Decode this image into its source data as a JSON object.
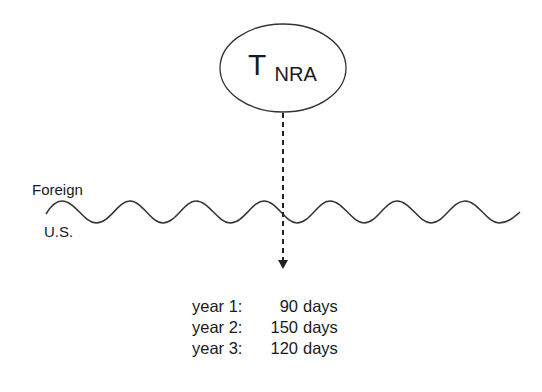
{
  "node": {
    "symbol": "T",
    "subscript": "NRA"
  },
  "labels": {
    "above_border": "Foreign",
    "below_border": "U.S."
  },
  "stays": [
    {
      "year": "year 1:",
      "value": "90",
      "unit": "days"
    },
    {
      "year": "year 2:",
      "value": "150",
      "unit": "days"
    },
    {
      "year": "year 3:",
      "value": "120",
      "unit": "days"
    }
  ],
  "colors": {
    "stroke": "#333333",
    "text": "#1a1a1a"
  }
}
